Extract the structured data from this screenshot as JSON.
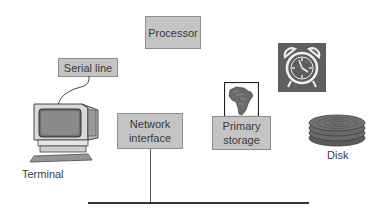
{
  "diagram": {
    "nodes": [
      {
        "id": "processor",
        "label": "Processor"
      },
      {
        "id": "serial-line",
        "label": "Serial line"
      },
      {
        "id": "network-interface",
        "label": "Network\ninterface"
      },
      {
        "id": "primary-storage",
        "label": "Primary\nstorage"
      },
      {
        "id": "terminal",
        "label": "Terminal"
      },
      {
        "id": "disk",
        "label": "Disk"
      }
    ],
    "icons": {
      "terminal": "computer-terminal-icon",
      "primary_storage": "africa-map-icon",
      "clock": "alarm-clock-icon",
      "disk": "disk-platters-icon"
    },
    "edges": [
      {
        "from": "serial-line",
        "to": "terminal",
        "style": "curved-cable"
      },
      {
        "from": "network-interface",
        "to": "network-bus",
        "style": "vertical-line"
      }
    ],
    "colors": {
      "box_fill": "#c4c4c4",
      "box_border": "#8e8e8e",
      "icon_dark": "#5a5a5a",
      "line": "#333333"
    }
  },
  "labels": {
    "processor": "Processor",
    "serial_line": "Serial line",
    "network_line1": "Network",
    "network_line2": "interface",
    "primary_line1": "Primary",
    "primary_line2": "storage",
    "terminal": "Terminal",
    "disk": "Disk"
  }
}
